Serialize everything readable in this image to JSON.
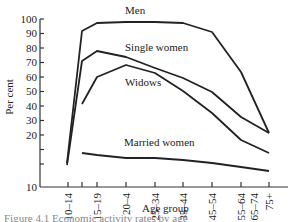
{
  "chart_data": {
    "type": "line",
    "title": "",
    "xlabel": "Age group",
    "ylabel": "Per cent",
    "ylim": [
      10,
      100
    ],
    "yticks": [
      10,
      20,
      30,
      40,
      50,
      60,
      70,
      80,
      90,
      100
    ],
    "grid": false,
    "legend_position": "inline labels",
    "categories": [
      "10–14",
      "15–19",
      "20–4",
      "25–34",
      "35–44",
      "45–54",
      "55–64",
      "65–74",
      "75+"
    ],
    "series": [
      {
        "name": "Men",
        "values": [
          27,
          91,
          96,
          97,
          97,
          95,
          89,
          65,
          38
        ]
      },
      {
        "name": "Single women",
        "values": [
          25,
          70,
          77,
          73,
          67,
          60,
          50,
          33,
          23
        ]
      },
      {
        "name": "Widows",
        "values": [
          null,
          50,
          60,
          66,
          60,
          52,
          37,
          27,
          20
        ]
      },
      {
        "name": "Married women",
        "values": [
          null,
          23,
          22,
          20,
          20,
          19,
          17,
          15,
          13
        ]
      }
    ],
    "caption": "Figure 4.1   Economic activity rates by age"
  },
  "labels": {
    "men": "Men",
    "single_women": "Single women",
    "widows": "Widows",
    "married_women": "Married women",
    "ylabel": "Per cent",
    "xlabel": "Age group",
    "caption": "Figure 4.1   Economic activity rates by age"
  },
  "yticks": [
    "100",
    "90",
    "80",
    "70",
    "60",
    "50",
    "40",
    "30",
    "20",
    "10"
  ],
  "xticks": [
    "10–14",
    "15–19",
    "20–4",
    "25–34",
    "35–44",
    "45–54",
    "55–64",
    "65–74",
    "75+"
  ]
}
